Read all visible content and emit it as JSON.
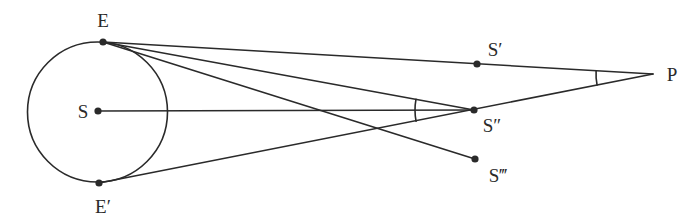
{
  "diagram": {
    "type": "geometry-parallax",
    "circle": {
      "name": "orbit",
      "cx": 97.5,
      "cy": 112,
      "r": 70
    },
    "points": {
      "E": {
        "label": "E",
        "x": 103,
        "y": 42,
        "lx": 103,
        "ly": 27,
        "anchor": "middle"
      },
      "Ep": {
        "label": "E′",
        "x": 99,
        "y": 183,
        "lx": 103,
        "ly": 213,
        "anchor": "middle"
      },
      "S": {
        "label": "S",
        "x": 98,
        "y": 111,
        "lx": 83,
        "ly": 118,
        "anchor": "middle"
      },
      "Sp": {
        "label": "S′",
        "x": 477,
        "y": 64,
        "lx": 495,
        "ly": 56,
        "anchor": "middle"
      },
      "Spp": {
        "label": "S″",
        "x": 474,
        "y": 110,
        "lx": 492,
        "ly": 132,
        "anchor": "middle"
      },
      "Sppp": {
        "label": "S‴",
        "x": 475,
        "y": 159,
        "lx": 498,
        "ly": 182,
        "anchor": "middle"
      },
      "P": {
        "label": "P",
        "x": 653,
        "y": 74,
        "lx": 672,
        "ly": 81,
        "anchor": "middle"
      }
    },
    "lines": [
      {
        "name": "line-E-P",
        "from": "E",
        "to": "P"
      },
      {
        "name": "line-E-S2",
        "from": "E",
        "to": "Spp"
      },
      {
        "name": "line-E-S3",
        "from": "E",
        "to": "Sppp"
      },
      {
        "name": "line-S-S2",
        "from": "S",
        "to": "Spp"
      },
      {
        "name": "line-Ep-P",
        "from": "Ep",
        "to": "P"
      }
    ],
    "angle_arcs": [
      {
        "name": "angle-at-S2",
        "vertex": "Spp",
        "r": 59
      },
      {
        "name": "angle-at-P",
        "vertex": "P",
        "r": 57
      }
    ]
  }
}
